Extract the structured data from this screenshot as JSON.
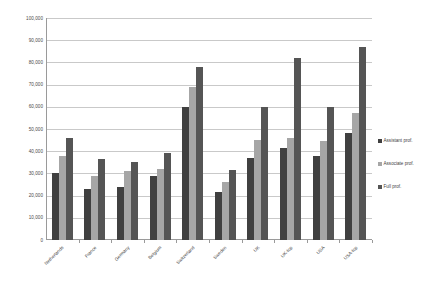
{
  "chart_data": {
    "type": "bar",
    "title": "",
    "subtitle": "",
    "xlabel": "",
    "ylabel": "",
    "ylim": [
      0,
      100000
    ],
    "ytick_step": 10000,
    "grid": true,
    "legend_position": "right",
    "categories": [
      "Netherlands",
      "France",
      "Germany",
      "Belgium",
      "Switzerland",
      "Sweden",
      "UK",
      "UK-top",
      "USA",
      "USA-top"
    ],
    "ytick_labels": [
      "100,000",
      "90,000",
      "80,000",
      "70,000",
      "60,000",
      "50,000",
      "40,000",
      "30,000",
      "20,000",
      "10,000",
      "0"
    ],
    "ytick_values": [
      100000,
      90000,
      80000,
      70000,
      60000,
      50000,
      40000,
      30000,
      20000,
      10000,
      0
    ],
    "series": [
      {
        "name": "Assistant prof.",
        "color": "#404040",
        "values": [
          30000,
          23000,
          24000,
          29000,
          60000,
          21500,
          37000,
          41500,
          38000,
          48000
        ]
      },
      {
        "name": "Associate prof.",
        "color": "#a6a6a6",
        "values": [
          38000,
          29000,
          31000,
          32000,
          69000,
          26000,
          45000,
          46000,
          44500,
          57000
        ]
      },
      {
        "name": "Full prof.",
        "color": "#555555",
        "values": [
          46000,
          36500,
          35000,
          39000,
          78000,
          31500,
          60000,
          82000,
          60000,
          87000
        ]
      }
    ]
  },
  "legend": {
    "items": [
      {
        "label": "Assistant prof."
      },
      {
        "label": "Associate prof."
      },
      {
        "label": "Full prof."
      }
    ]
  }
}
